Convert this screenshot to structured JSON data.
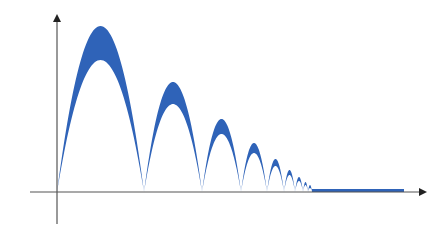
{
  "diagram": {
    "type": "decaying-bounces",
    "colors": {
      "band": "#2f63b8",
      "axis": "#555555",
      "background": "#ffffff"
    },
    "axes": {
      "origin": [
        57,
        192
      ],
      "x_axis": {
        "from": 30,
        "to": 425,
        "y": 192,
        "arrow": true
      },
      "y_axis": {
        "x": 57,
        "from": 224,
        "to": 16,
        "arrow": true
      },
      "labels": []
    },
    "bounces": [
      {
        "x0": 57,
        "x1": 144,
        "outer_peak_y": 26,
        "inner_peak_y": 60
      },
      {
        "x0": 144,
        "x1": 202,
        "outer_peak_y": 82,
        "inner_peak_y": 104
      },
      {
        "x0": 202,
        "x1": 241,
        "outer_peak_y": 119,
        "inner_peak_y": 134
      },
      {
        "x0": 241,
        "x1": 267,
        "outer_peak_y": 143,
        "inner_peak_y": 153
      },
      {
        "x0": 267,
        "x1": 284,
        "outer_peak_y": 159,
        "inner_peak_y": 166
      },
      {
        "x0": 284,
        "x1": 295,
        "outer_peak_y": 170,
        "inner_peak_y": 175
      },
      {
        "x0": 295,
        "x1": 303,
        "outer_peak_y": 177,
        "inner_peak_y": 181
      },
      {
        "x0": 303,
        "x1": 308,
        "outer_peak_y": 182,
        "inner_peak_y": 185
      },
      {
        "x0": 308,
        "x1": 312,
        "outer_peak_y": 185,
        "inner_peak_y": 188
      }
    ],
    "rest_band": {
      "x0": 312,
      "x1": 404,
      "y_top": 189,
      "y_bottom": 192
    }
  }
}
